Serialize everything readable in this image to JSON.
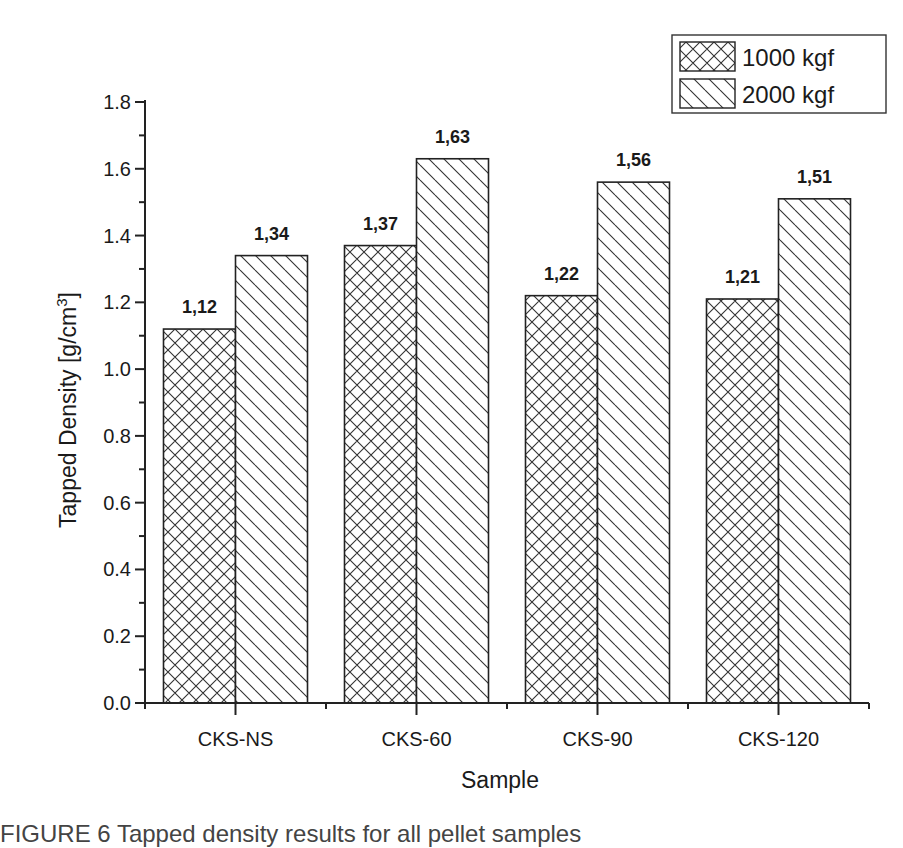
{
  "chart_data": {
    "type": "bar",
    "title": "",
    "xlabel": "Sample",
    "ylabel": "Tapped Density [g/cm3]",
    "ylabel_main": "Tapped Density [g/cm",
    "ylabel_sup": "3",
    "ylabel_close": "]",
    "ylim": [
      0.0,
      1.8
    ],
    "yticks": [
      "0.0",
      "0.2",
      "0.4",
      "0.6",
      "0.8",
      "1.0",
      "1.2",
      "1.4",
      "1.6",
      "1.8"
    ],
    "categories": [
      "CKS-NS",
      "CKS-60",
      "CKS-90",
      "CKS-120"
    ],
    "series": [
      {
        "name": "1000 kgf",
        "pattern": "crosshatch",
        "values": [
          1.12,
          1.37,
          1.22,
          1.21
        ],
        "labels": [
          "1,12",
          "1,37",
          "1,22",
          "1,21"
        ]
      },
      {
        "name": "2000 kgf",
        "pattern": "diagonal",
        "values": [
          1.34,
          1.63,
          1.56,
          1.51
        ],
        "labels": [
          "1,34",
          "1,63",
          "1,56",
          "1,51"
        ]
      }
    ],
    "legend_position": "top-right",
    "grid": false
  },
  "caption_partial": "FIGURE 6 Tapped density results for all pellet samples"
}
